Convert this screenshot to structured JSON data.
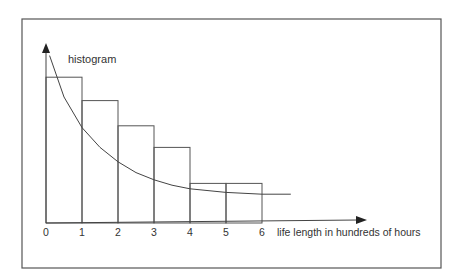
{
  "chart_data": {
    "type": "bar",
    "title": "",
    "annotation": "histogram",
    "xlabel": "life length in hundreds of hours",
    "ylabel": "",
    "x_ticks": [
      "0",
      "1",
      "2",
      "3",
      "4",
      "5",
      "6"
    ],
    "x_range": [
      0,
      6
    ],
    "bins": [
      {
        "from": 0,
        "to": 1,
        "relative_height": 0.81
      },
      {
        "from": 1,
        "to": 2,
        "relative_height": 0.68
      },
      {
        "from": 2,
        "to": 3,
        "relative_height": 0.54
      },
      {
        "from": 3,
        "to": 4,
        "relative_height": 0.42
      },
      {
        "from": 4,
        "to": 5,
        "relative_height": 0.22
      },
      {
        "from": 5,
        "to": 6,
        "relative_height": 0.22
      }
    ],
    "curve": {
      "name": "exponential density",
      "points": [
        {
          "x": 0.1,
          "y": 0.93
        },
        {
          "x": 0.5,
          "y": 0.7
        },
        {
          "x": 1.0,
          "y": 0.53
        },
        {
          "x": 1.5,
          "y": 0.42
        },
        {
          "x": 2.0,
          "y": 0.34
        },
        {
          "x": 2.5,
          "y": 0.28
        },
        {
          "x": 3.0,
          "y": 0.24
        },
        {
          "x": 3.5,
          "y": 0.21
        },
        {
          "x": 4.0,
          "y": 0.19
        },
        {
          "x": 4.5,
          "y": 0.18
        },
        {
          "x": 5.0,
          "y": 0.17
        },
        {
          "x": 5.5,
          "y": 0.165
        },
        {
          "x": 6.0,
          "y": 0.16
        },
        {
          "x": 6.8,
          "y": 0.16
        }
      ]
    },
    "grid": false,
    "colors": {
      "line": "#555555",
      "text": "#333333",
      "frame": "#555555"
    }
  }
}
